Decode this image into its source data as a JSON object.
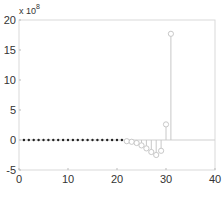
{
  "chart_data": {
    "type": "stem",
    "title": "",
    "xlabel": "",
    "ylabel": "",
    "y_multiplier_label": "x 10",
    "y_multiplier_exponent": "8",
    "xlim": [
      0,
      40
    ],
    "ylim": [
      -5,
      20
    ],
    "xticks": [
      "0",
      "10",
      "20",
      "30",
      "40"
    ],
    "yticks": [
      "-5",
      "0",
      "5",
      "10",
      "15",
      "20"
    ],
    "grid": false,
    "series": [
      {
        "name": "filled",
        "marker": "filled-dot",
        "color": "#222222",
        "x": [
          1,
          2,
          3,
          4,
          5,
          6,
          7,
          8,
          9,
          10,
          11,
          12,
          13,
          14,
          15,
          16,
          17,
          18,
          19,
          20,
          21
        ],
        "values": [
          0,
          0,
          0,
          0,
          0,
          0,
          0,
          0,
          0,
          0,
          0,
          0,
          0,
          0,
          0,
          0,
          0,
          0,
          0,
          0,
          0
        ]
      },
      {
        "name": "open",
        "marker": "open-circle",
        "color": "#c8c8c8",
        "x": [
          22,
          23,
          24,
          25,
          26,
          27,
          28,
          29,
          30,
          31
        ],
        "values": [
          -0.2,
          -0.3,
          -0.5,
          -0.9,
          -1.4,
          -2.0,
          -2.5,
          -1.8,
          2.6,
          17.7
        ]
      }
    ]
  }
}
